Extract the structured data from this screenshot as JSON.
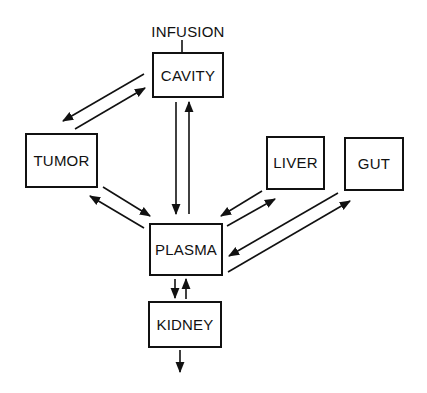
{
  "diagram": {
    "title": "",
    "input_label": "INFUSION",
    "nodes": [
      {
        "id": "cavity",
        "label": "CAVITY",
        "x": 153,
        "y": 53,
        "w": 70,
        "h": 44
      },
      {
        "id": "tumor",
        "label": "TUMOR",
        "x": 26,
        "y": 134,
        "w": 71,
        "h": 53
      },
      {
        "id": "liver",
        "label": "LIVER",
        "x": 267,
        "y": 137,
        "w": 57,
        "h": 52
      },
      {
        "id": "gut",
        "label": "GUT",
        "x": 345,
        "y": 138,
        "w": 58,
        "h": 52
      },
      {
        "id": "plasma",
        "label": "PLASMA",
        "x": 150,
        "y": 224,
        "w": 72,
        "h": 51
      },
      {
        "id": "kidney",
        "label": "KIDNEY",
        "x": 149,
        "y": 302,
        "w": 72,
        "h": 45
      }
    ],
    "edges": [
      {
        "from": "infusion",
        "to": "cavity"
      },
      {
        "from": "cavity",
        "to": "tumor"
      },
      {
        "from": "tumor",
        "to": "cavity"
      },
      {
        "from": "cavity",
        "to": "plasma"
      },
      {
        "from": "plasma",
        "to": "cavity"
      },
      {
        "from": "tumor",
        "to": "plasma"
      },
      {
        "from": "plasma",
        "to": "tumor"
      },
      {
        "from": "liver",
        "to": "plasma"
      },
      {
        "from": "plasma",
        "to": "liver"
      },
      {
        "from": "gut",
        "to": "plasma"
      },
      {
        "from": "plasma",
        "to": "gut"
      },
      {
        "from": "plasma",
        "to": "kidney"
      },
      {
        "from": "kidney",
        "to": "plasma"
      },
      {
        "from": "kidney",
        "to": "excretion"
      }
    ],
    "colors": {
      "stroke": "#111111",
      "background": "#ffffff"
    }
  }
}
